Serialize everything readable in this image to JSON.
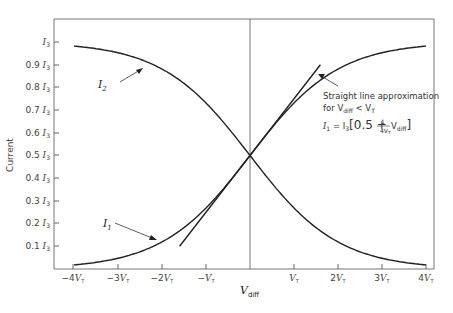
{
  "chart_data": {
    "type": "line",
    "title": "",
    "xlabel": "V_diff",
    "ylabel": "Current",
    "x_ticks": [
      "-4V_T",
      "-3V_T",
      "-2V_T",
      "-V_T",
      "V_T",
      "2V_T",
      "3V_T",
      "4V_T"
    ],
    "y_ticks": [
      "0.1I_3",
      "0.2I_3",
      "0.3I_3",
      "0.4I_3",
      "0.5I_3",
      "0.6I_3",
      "0.7I_3",
      "0.8I_3",
      "0.9I_3",
      "I_3"
    ],
    "x_units": "V_T",
    "xlim": [
      -4,
      4
    ],
    "ylim": [
      0,
      1
    ],
    "grid": false,
    "legend": "none (inline labels)",
    "x": [
      -4,
      -3,
      -2,
      -1,
      0,
      1,
      2,
      3,
      4
    ],
    "series": [
      {
        "name": "I1",
        "values": [
          0.018,
          0.047,
          0.119,
          0.269,
          0.5,
          0.731,
          0.881,
          0.953,
          0.982
        ]
      },
      {
        "name": "I2",
        "values": [
          0.982,
          0.953,
          0.881,
          0.731,
          0.5,
          0.269,
          0.119,
          0.047,
          0.018
        ]
      },
      {
        "name": "Straight line approximation",
        "x_range": [
          -1.6,
          1.6
        ],
        "values_at_range": [
          0.1,
          0.9
        ],
        "formula": "I1 = I3[0.5 + (1/(4V_T)) V_diff]"
      }
    ],
    "annotations": [
      "I_2",
      "I_1",
      "Straight line approximation",
      "for V_diff < V_T",
      "I_1 = I_3 [ 0.5 + 1/(4V_T) V_diff ]"
    ]
  },
  "labels": {
    "ylabel": "Current",
    "xlabel_main": "V",
    "xlabel_sub": "diff",
    "i2": "I",
    "i2_sub": "2",
    "i1": "I",
    "i1_sub": "1",
    "ann_line1": "Straight line approximation",
    "ann_line2_pre": "for V",
    "ann_line2_sub": "diff",
    "ann_line2_post": " < V",
    "ann_line2_sub2": "T",
    "formula_lhs": "I",
    "formula_lhs_sub": "1",
    "formula_eq": " = I",
    "formula_eq_sub": "3",
    "formula_body": "[0.5 + ",
    "formula_frac_num": "1",
    "formula_frac_den": "4V",
    "formula_frac_den_sub": "T",
    "formula_tail": " V",
    "formula_tail_sub": "diff",
    "formula_close": "]"
  },
  "y_tick_labels": [
    {
      "text": "I",
      "pre": "",
      "sub": "3",
      "y": 42
    },
    {
      "text": "I",
      "pre": "0.9",
      "sub": "3",
      "y": 65
    },
    {
      "text": "I",
      "pre": "0.8",
      "sub": "3",
      "y": 87
    },
    {
      "text": "I",
      "pre": "0.7",
      "sub": "3",
      "y": 110
    },
    {
      "text": "I",
      "pre": "0.6",
      "sub": "3",
      "y": 133
    },
    {
      "text": "I",
      "pre": "0.5",
      "sub": "3",
      "y": 155
    },
    {
      "text": "I",
      "pre": "0.4",
      "sub": "3",
      "y": 178
    },
    {
      "text": "I",
      "pre": "0.3",
      "sub": "3",
      "y": 201
    },
    {
      "text": "I",
      "pre": "0.2",
      "sub": "3",
      "y": 223
    },
    {
      "text": "I",
      "pre": "0.1",
      "sub": "3",
      "y": 246
    }
  ],
  "x_tick_labels": [
    {
      "pre": "−4",
      "x": 73
    },
    {
      "pre": "−3",
      "x": 118
    },
    {
      "pre": "−2",
      "x": 162
    },
    {
      "pre": "−",
      "x": 206
    },
    {
      "pre": "",
      "x": 294
    },
    {
      "pre": "2",
      "x": 338
    },
    {
      "pre": "3",
      "x": 382
    },
    {
      "pre": "4",
      "x": 426
    }
  ]
}
